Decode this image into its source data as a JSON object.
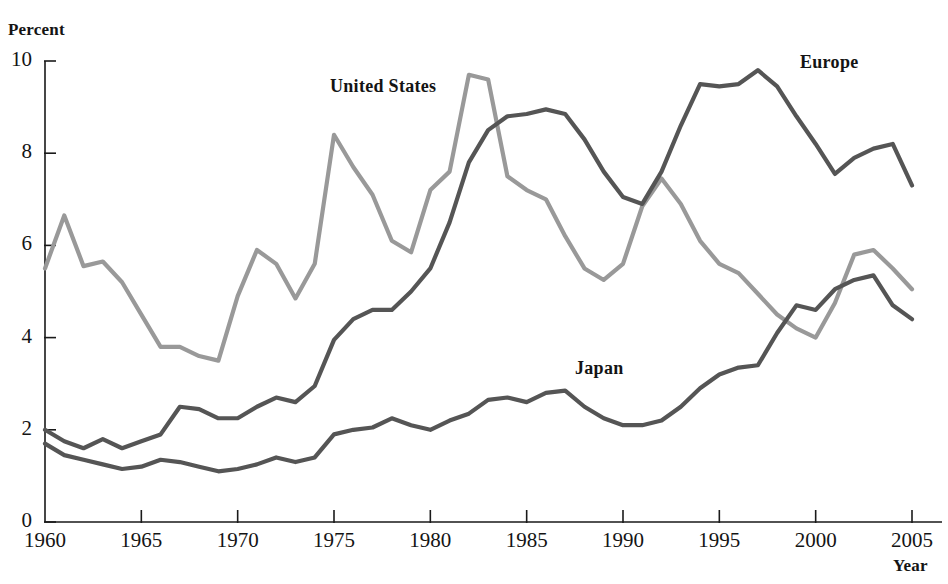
{
  "chart_data": {
    "type": "line",
    "title": "",
    "xlabel": "Year",
    "ylabel": "Percent",
    "xlim": [
      1960,
      2005
    ],
    "ylim": [
      0,
      10
    ],
    "grid": false,
    "legend_position": "inline-annotations",
    "xticks": [
      "1960",
      "1965",
      "1970",
      "1975",
      "1980",
      "1985",
      "1990",
      "1995",
      "2000",
      "2005"
    ],
    "xtick_values": [
      1960,
      1965,
      1970,
      1975,
      1980,
      1985,
      1990,
      1995,
      2000,
      2005
    ],
    "yticks": [
      "0",
      "2",
      "4",
      "6",
      "8",
      "10"
    ],
    "ytick_values": [
      0,
      2,
      4,
      6,
      8,
      10
    ],
    "x": [
      1960,
      1961,
      1962,
      1963,
      1964,
      1965,
      1966,
      1967,
      1968,
      1969,
      1970,
      1971,
      1972,
      1973,
      1974,
      1975,
      1976,
      1977,
      1978,
      1979,
      1980,
      1981,
      1982,
      1983,
      1984,
      1985,
      1986,
      1987,
      1988,
      1989,
      1990,
      1991,
      1992,
      1993,
      1994,
      1995,
      1996,
      1997,
      1998,
      1999,
      2000,
      2001,
      2002,
      2003,
      2004,
      2005
    ],
    "series": [
      {
        "name": "United States",
        "color": "#999999",
        "values": [
          5.5,
          6.65,
          5.55,
          5.65,
          5.2,
          4.5,
          3.8,
          3.8,
          3.6,
          3.5,
          4.9,
          5.9,
          5.6,
          4.85,
          5.6,
          8.4,
          7.7,
          7.1,
          6.1,
          5.85,
          7.2,
          7.6,
          9.7,
          9.6,
          7.5,
          7.2,
          7.0,
          6.2,
          5.5,
          5.25,
          5.6,
          6.85,
          7.45,
          6.9,
          6.1,
          5.6,
          5.4,
          4.95,
          4.5,
          4.2,
          4.0,
          4.75,
          5.8,
          5.9,
          5.5,
          5.05
        ]
      },
      {
        "name": "Europe",
        "color": "#555555",
        "values": [
          2.0,
          1.75,
          1.6,
          1.8,
          1.6,
          1.75,
          1.9,
          2.5,
          2.45,
          2.25,
          2.25,
          2.5,
          2.7,
          2.6,
          2.95,
          3.95,
          4.4,
          4.6,
          4.6,
          5.0,
          5.5,
          6.5,
          7.8,
          8.5,
          8.8,
          8.85,
          8.95,
          8.85,
          8.3,
          7.6,
          7.05,
          6.9,
          7.6,
          8.6,
          9.5,
          9.45,
          9.5,
          9.8,
          9.45,
          8.8,
          8.2,
          7.55,
          7.9,
          8.1,
          8.2,
          7.3
        ]
      },
      {
        "name": "Japan",
        "color": "#555555",
        "values": [
          1.7,
          1.45,
          1.35,
          1.25,
          1.15,
          1.2,
          1.35,
          1.3,
          1.2,
          1.1,
          1.15,
          1.25,
          1.4,
          1.3,
          1.4,
          1.9,
          2.0,
          2.05,
          2.25,
          2.1,
          2.0,
          2.2,
          2.35,
          2.65,
          2.7,
          2.6,
          2.8,
          2.85,
          2.5,
          2.25,
          2.1,
          2.1,
          2.2,
          2.5,
          2.9,
          3.2,
          3.35,
          3.4,
          4.1,
          4.7,
          4.6,
          5.05,
          5.25,
          5.35,
          4.7,
          4.4
        ]
      }
    ],
    "annotations": [
      {
        "text": "United States",
        "series": "United States"
      },
      {
        "text": "Europe",
        "series": "Europe"
      },
      {
        "text": "Japan",
        "series": "Japan"
      }
    ]
  },
  "axes": {
    "y_axis_title": "Percent",
    "x_axis_title": "Year",
    "axis_color": "#1a1a1a"
  },
  "labels": {
    "united_states": "United States",
    "europe": "Europe",
    "japan": "Japan"
  },
  "ytick_text": {
    "t0": "0",
    "t2": "2",
    "t4": "4",
    "t6": "6",
    "t8": "8",
    "t10": "10"
  },
  "xtick_text": {
    "t1960": "1960",
    "t1965": "1965",
    "t1970": "1970",
    "t1975": "1975",
    "t1980": "1980",
    "t1985": "1985",
    "t1990": "1990",
    "t1995": "1995",
    "t2000": "2000",
    "t2005": "2005"
  }
}
